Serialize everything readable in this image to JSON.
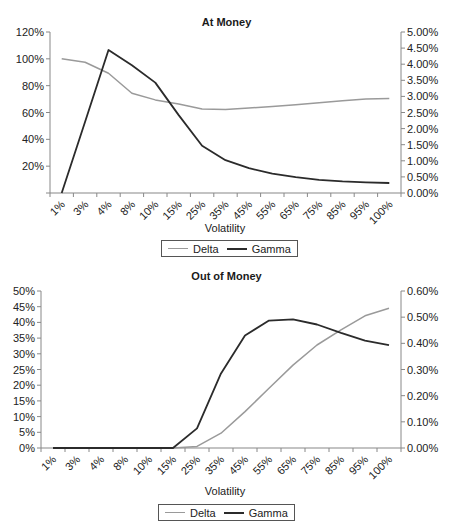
{
  "colors": {
    "delta": "#9a9a9a",
    "gamma": "#2b2b2b",
    "axis": "#888888"
  },
  "chart_data": [
    {
      "type": "line",
      "title": "At Money",
      "xlabel": "Volatility",
      "ylabel": "",
      "y2label": "",
      "categories": [
        "1%",
        "3%",
        "4%",
        "8%",
        "10%",
        "15%",
        "25%",
        "35%",
        "45%",
        "55%",
        "65%",
        "75%",
        "85%",
        "95%",
        "100%"
      ],
      "series": [
        {
          "name": "Delta",
          "axis": "left",
          "values": [
            100,
            97.5,
            89.3,
            74.4,
            69.4,
            66.4,
            62.7,
            62.3,
            63.3,
            64.5,
            65.8,
            67.3,
            68.7,
            70.0,
            70.5
          ]
        },
        {
          "name": "Gamma",
          "axis": "right",
          "values": [
            0.0,
            2.21,
            4.44,
            3.97,
            3.43,
            2.42,
            1.47,
            1.02,
            0.77,
            0.6,
            0.49,
            0.41,
            0.36,
            0.33,
            0.31
          ]
        }
      ],
      "ylim": [
        0,
        120
      ],
      "y2lim": [
        0,
        5
      ],
      "yticks": [
        "",
        "20%",
        "40%",
        "60%",
        "80%",
        "100%",
        "120%"
      ],
      "y2ticks": [
        "0.00%",
        "0.50%",
        "1.00%",
        "1.50%",
        "2.00%",
        "2.50%",
        "3.00%",
        "3.50%",
        "4.00%",
        "4.50%",
        "5.00%"
      ],
      "grid": false,
      "legend_position": "bottom"
    },
    {
      "type": "line",
      "title": "Out of Money",
      "xlabel": "Volatility",
      "ylabel": "",
      "y2label": "",
      "categories": [
        "1%",
        "3%",
        "4%",
        "8%",
        "10%",
        "15%",
        "25%",
        "35%",
        "45%",
        "55%",
        "65%",
        "75%",
        "85%",
        "95%",
        "100%"
      ],
      "series": [
        {
          "name": "Delta",
          "axis": "left",
          "values": [
            0,
            0,
            0,
            0,
            0,
            0,
            0.5,
            4.7,
            11.6,
            19.0,
            26.4,
            32.8,
            37.6,
            42.1,
            44.5
          ]
        },
        {
          "name": "Gamma",
          "axis": "right",
          "values": [
            0,
            0,
            0,
            0,
            0,
            0,
            0.075,
            0.285,
            0.43,
            0.487,
            0.492,
            0.472,
            0.44,
            0.41,
            0.393
          ]
        }
      ],
      "ylim": [
        0,
        50
      ],
      "y2lim": [
        0,
        0.6
      ],
      "yticks": [
        "0%",
        "5%",
        "10%",
        "15%",
        "20%",
        "25%",
        "30%",
        "35%",
        "40%",
        "45%",
        "50%"
      ],
      "y2ticks": [
        "0.00%",
        "0.10%",
        "0.20%",
        "0.30%",
        "0.40%",
        "0.50%",
        "0.60%"
      ],
      "grid": false,
      "legend_position": "bottom"
    }
  ],
  "legend": {
    "items": [
      {
        "label": "Delta"
      },
      {
        "label": "Gamma"
      }
    ]
  }
}
